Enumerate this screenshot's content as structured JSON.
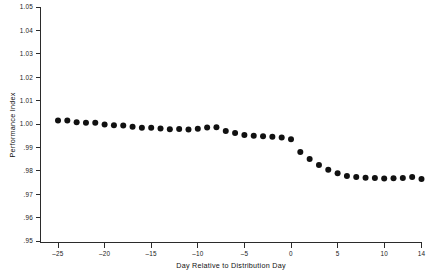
{
  "chart_data": {
    "type": "scatter",
    "title": "",
    "xlabel": "Day Relative to Distribution Day",
    "ylabel": "Performance Index",
    "xlim": [
      -27,
      14
    ],
    "ylim": [
      0.95,
      1.05
    ],
    "grid": false,
    "legend": null,
    "xticks": [
      -25,
      -20,
      -15,
      -10,
      -5,
      0,
      5,
      10,
      14
    ],
    "xticklabels": [
      "–25",
      "–20",
      "–15",
      "–10",
      "–5",
      "0",
      "5",
      "10",
      "14"
    ],
    "yticks": [
      0.95,
      0.96,
      0.97,
      0.98,
      0.99,
      1.0,
      1.01,
      1.02,
      1.03,
      1.04,
      1.05
    ],
    "yticklabels": [
      ".95",
      ".96",
      ".97",
      ".98",
      ".99",
      "1.00",
      "1.01",
      "1.02",
      "1.03",
      "1.04",
      "1.05"
    ],
    "marker": "filled-circle",
    "marker_color": "#111111",
    "marker_size_px": 3.0,
    "x": [
      -25,
      -24,
      -23,
      -22,
      -21,
      -20,
      -19,
      -18,
      -17,
      -16,
      -15,
      -14,
      -13,
      -12,
      -11,
      -10,
      -9,
      -8,
      -7,
      -6,
      -5,
      -4,
      -3,
      -2,
      -1,
      0,
      1,
      2,
      3,
      4,
      5,
      6,
      7,
      8,
      9,
      10,
      11,
      12,
      13,
      14
    ],
    "y": [
      1.0015,
      1.0015,
      1.0008,
      1.0005,
      1.0005,
      0.9998,
      0.9995,
      0.9994,
      0.9988,
      0.9984,
      0.9984,
      0.9981,
      0.9978,
      0.9979,
      0.9977,
      0.998,
      0.9985,
      0.9986,
      0.997,
      0.9962,
      0.9953,
      0.995,
      0.9948,
      0.9946,
      0.9942,
      0.9935,
      0.988,
      0.985,
      0.9825,
      0.9805,
      0.979,
      0.9778,
      0.9773,
      0.977,
      0.9769,
      0.9767,
      0.9768,
      0.9769,
      0.9774,
      0.9765
    ]
  },
  "plot_geometry": {
    "axis_color": "#2b2b2b",
    "background": "#ffffff"
  }
}
